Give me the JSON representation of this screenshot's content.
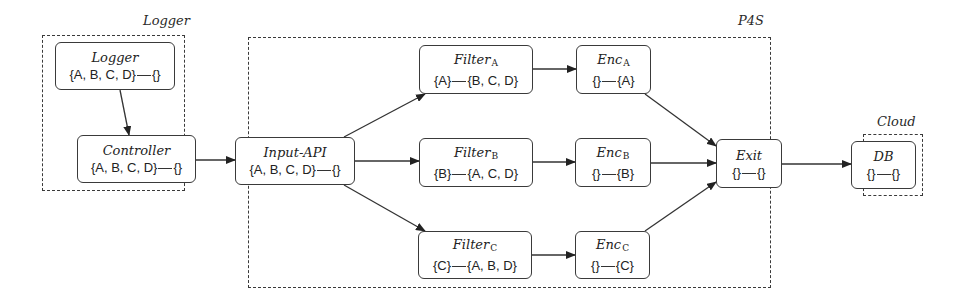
{
  "groups": [
    {
      "id": "logger-group",
      "label": "Logger",
      "x": 42,
      "y": 35,
      "w": 143,
      "h": 156,
      "label_x": 143,
      "label_y": 13
    },
    {
      "id": "p4s-group",
      "label": "P4S",
      "x": 248,
      "y": 37,
      "w": 523,
      "h": 251,
      "label_x": 738,
      "label_y": 13
    },
    {
      "id": "cloud-group",
      "label": "Cloud",
      "x": 863,
      "y": 134,
      "w": 60,
      "h": 62,
      "label_x": 877,
      "label_y": 114
    }
  ],
  "nodes": [
    {
      "id": "logger",
      "title": "Logger",
      "sub": "",
      "left": "{A, B, C, D}",
      "right": "{}",
      "x": 55,
      "y": 42,
      "w": 120,
      "h": 48
    },
    {
      "id": "controller",
      "title": "Controller",
      "sub": "",
      "left": "{A, B, C, D}",
      "right": "{}",
      "x": 77,
      "y": 135,
      "w": 119,
      "h": 48
    },
    {
      "id": "input-api",
      "title": "Input-API",
      "sub": "",
      "left": "{A, B, C, D}",
      "right": "{}",
      "x": 235,
      "y": 137,
      "w": 120,
      "h": 48
    },
    {
      "id": "filter-a",
      "title": "Filter",
      "sub": "A",
      "left": "{A}",
      "right": "{B, C, D}",
      "x": 419,
      "y": 45,
      "w": 114,
      "h": 49
    },
    {
      "id": "filter-b",
      "title": "Filter",
      "sub": "B",
      "left": "{B}",
      "right": "{A, C, D}",
      "x": 419,
      "y": 138,
      "w": 114,
      "h": 49
    },
    {
      "id": "filter-c",
      "title": "Filter",
      "sub": "C",
      "left": "{C}",
      "right": "{A, B, D}",
      "x": 418,
      "y": 231,
      "w": 114,
      "h": 48
    },
    {
      "id": "enc-a",
      "title": "Enc",
      "sub": "A",
      "left": "{}",
      "right": "{A}",
      "x": 576,
      "y": 45,
      "w": 75,
      "h": 49
    },
    {
      "id": "enc-b",
      "title": "Enc",
      "sub": "B",
      "left": "{}",
      "right": "{B}",
      "x": 575,
      "y": 138,
      "w": 76,
      "h": 49
    },
    {
      "id": "enc-c",
      "title": "Enc",
      "sub": "C",
      "left": "{}",
      "right": "{C}",
      "x": 575,
      "y": 231,
      "w": 75,
      "h": 48
    },
    {
      "id": "exit",
      "title": "Exit",
      "sub": "",
      "left": "{}",
      "right": "{}",
      "x": 716,
      "y": 139,
      "w": 66,
      "h": 49
    },
    {
      "id": "db",
      "title": "DB",
      "sub": "",
      "left": "{}",
      "right": "{}",
      "x": 851,
      "y": 141,
      "w": 65,
      "h": 48
    }
  ],
  "edges": [
    {
      "from": "logger",
      "to": "controller",
      "x1": 120,
      "y1": 90,
      "x2": 129,
      "y2": 135
    },
    {
      "from": "controller",
      "to": "input-api",
      "x1": 196,
      "y1": 160,
      "x2": 235,
      "y2": 160
    },
    {
      "from": "input-api",
      "to": "filter-a",
      "x1": 344,
      "y1": 137,
      "x2": 425,
      "y2": 94
    },
    {
      "from": "input-api",
      "to": "filter-b",
      "x1": 355,
      "y1": 161,
      "x2": 419,
      "y2": 161
    },
    {
      "from": "input-api",
      "to": "filter-c",
      "x1": 344,
      "y1": 185,
      "x2": 425,
      "y2": 231
    },
    {
      "from": "filter-a",
      "to": "enc-a",
      "x1": 533,
      "y1": 69,
      "x2": 576,
      "y2": 69
    },
    {
      "from": "filter-b",
      "to": "enc-b",
      "x1": 533,
      "y1": 162,
      "x2": 575,
      "y2": 162
    },
    {
      "from": "filter-c",
      "to": "enc-c",
      "x1": 532,
      "y1": 255,
      "x2": 575,
      "y2": 255
    },
    {
      "from": "enc-a",
      "to": "exit",
      "x1": 645,
      "y1": 94,
      "x2": 716,
      "y2": 146
    },
    {
      "from": "enc-b",
      "to": "exit",
      "x1": 651,
      "y1": 163,
      "x2": 716,
      "y2": 163
    },
    {
      "from": "enc-c",
      "to": "exit",
      "x1": 645,
      "y1": 231,
      "x2": 716,
      "y2": 182
    },
    {
      "from": "exit",
      "to": "db",
      "x1": 782,
      "y1": 164,
      "x2": 851,
      "y2": 164
    }
  ],
  "colors": {
    "stroke": "#333333",
    "background": "#ffffff"
  }
}
